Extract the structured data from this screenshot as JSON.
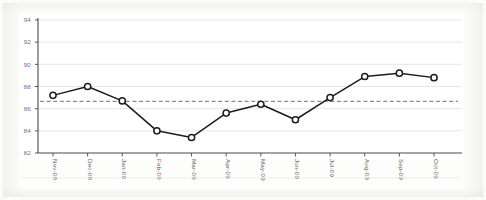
{
  "chart_data": {
    "type": "line",
    "title": "",
    "subtitle": "",
    "xlabel": "",
    "ylabel": "",
    "categories": [
      "Nov-08",
      "Dec-08",
      "Jan-09",
      "Feb-09",
      "Mar-09",
      "Apr-09",
      "May-09",
      "Jun-09",
      "Jul-09",
      "Aug-09",
      "Sep-09",
      "Oct-09"
    ],
    "series": [
      {
        "name": "value",
        "values": [
          87.2,
          88.0,
          86.7,
          84.0,
          83.4,
          85.6,
          86.4,
          85.0,
          87.0,
          88.9,
          89.2,
          88.8
        ],
        "marker": "circle",
        "line_color": "#1d1d1d",
        "marker_fill": "#ffffff"
      }
    ],
    "reference_line": {
      "value": 86.65,
      "style": "dashed",
      "color": "#8c8c8c",
      "label": ""
    },
    "ylim": [
      82,
      94
    ],
    "yticks": [
      82,
      84,
      86,
      88,
      90,
      92,
      94
    ],
    "ytick_labels": [
      "82",
      "84",
      "86",
      "88",
      "90",
      "92",
      "94"
    ],
    "grid": {
      "horizontal": true,
      "vertical": false,
      "color": "#d9dee3"
    },
    "legend": {
      "visible": false,
      "position": "none"
    },
    "xtick_rotation": 90,
    "plot_background": "#ffffff",
    "page_background": "#fbfbfa",
    "axis_color": "#4a4a4a"
  }
}
